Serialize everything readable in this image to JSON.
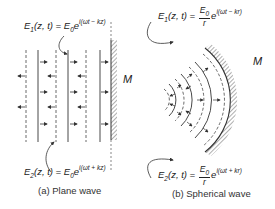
{
  "plane_wave": {
    "caption": "(a) Plane wave",
    "mirror_label": "M",
    "incident_eq": {
      "lhs": "E",
      "lhs_sub": "1",
      "args": "(z, t) = ",
      "amp": "E",
      "amp_sub": "0",
      "base": "e",
      "exponent": "i(ωt − kz)"
    },
    "reflected_eq": {
      "lhs": "E",
      "lhs_sub": "2",
      "args": "(z, t) = ",
      "amp": "E",
      "amp_sub": "0",
      "base": "e",
      "exponent": "i(ωt + kz)"
    }
  },
  "spherical_wave": {
    "caption": "(b) Spherical wave",
    "mirror_label": "M",
    "incident_eq": {
      "lhs": "E",
      "lhs_sub": "1",
      "args": "(z, t) = ",
      "num": "E",
      "num_sub": "0",
      "den": "r",
      "base": "e",
      "exponent": "i(ωt − kr)"
    },
    "reflected_eq": {
      "lhs": "E",
      "lhs_sub": "2",
      "args": "(z, t) = ",
      "num": "E",
      "num_sub": "0",
      "den": "r",
      "base": "e",
      "exponent": "i(ωt + kr)"
    }
  },
  "colors": {
    "line": "#333333",
    "text": "#222222"
  }
}
